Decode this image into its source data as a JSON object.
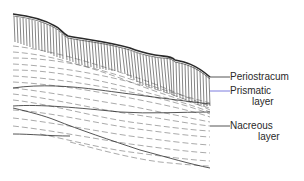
{
  "diagram": {
    "labels": [
      {
        "id": "periostracum",
        "text": "Periostracum"
      },
      {
        "id": "prismatic",
        "line1": "Prismatic",
        "line2": "layer"
      },
      {
        "id": "nacreous",
        "line1": "Nacreous",
        "line2": "layer"
      }
    ],
    "colors": {
      "ink": "#2a2a2a",
      "prismatic_leader": "#5b5bd6",
      "background": "#ffffff"
    }
  }
}
